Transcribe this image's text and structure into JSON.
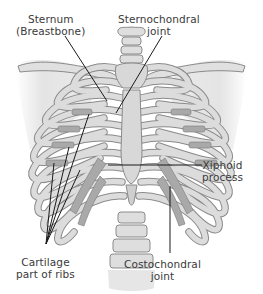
{
  "diagram": {
    "style": "grayscale medical illustration",
    "colors": {
      "background": "#ffffff",
      "bone_fill": "#dcdcdc",
      "bone_outline": "#8a8a8a",
      "cartilage_fill": "#a9a9a9",
      "shoulder_shadow": "#e6e6e6",
      "leader_line": "#1a1a1a",
      "label_text": "#3a3a3a"
    },
    "labels": [
      {
        "id": "sternum",
        "lines": [
          "Sternum",
          "(Breastbone)"
        ]
      },
      {
        "id": "sternochondral",
        "lines": [
          "Sternochondral",
          "joint"
        ]
      },
      {
        "id": "xiphoid",
        "lines": [
          "Xiphoid",
          "process"
        ]
      },
      {
        "id": "cartilage",
        "lines": [
          "Cartilage",
          "part of ribs"
        ]
      },
      {
        "id": "costochondral",
        "lines": [
          "Costochondral",
          "joint"
        ]
      }
    ]
  }
}
